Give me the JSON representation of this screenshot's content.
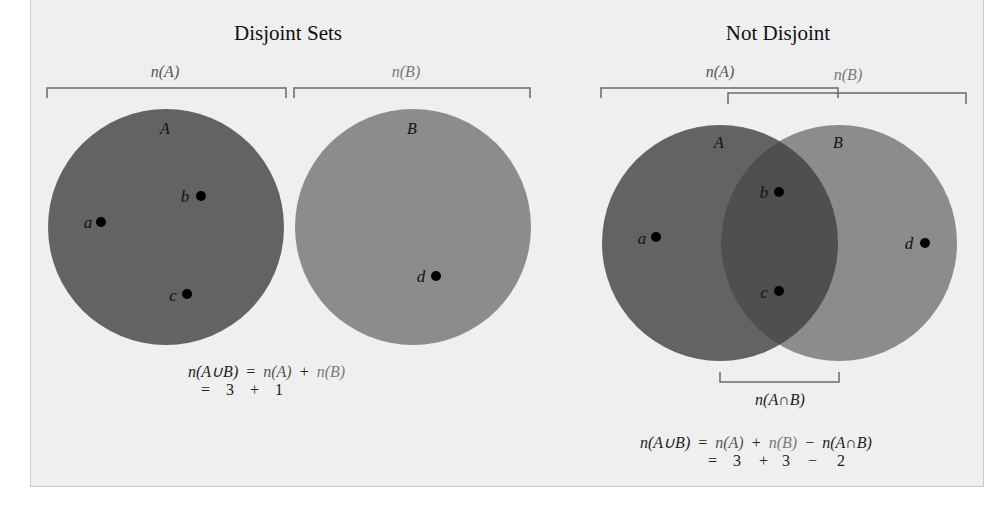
{
  "colors": {
    "background": "#efefef",
    "set_a_fill": "#636363",
    "set_b_fill": "#8c8c8c",
    "intersection_fill": "#4f4f4f",
    "bracket": "#6a6a6a"
  },
  "left": {
    "title": "Disjoint Sets",
    "bracket_a_label": "n(A)",
    "bracket_b_label": "n(B)",
    "set_a_name": "A",
    "set_b_name": "B",
    "points": {
      "a": "a",
      "b": "b",
      "c": "c",
      "d": "d"
    },
    "equation": {
      "lhs": "n(A∪B)",
      "eq": "=",
      "term1": "n(A)",
      "op1": "+",
      "term2": "n(B)",
      "line2_eq": "=",
      "v1": "3",
      "v_op1": "+",
      "v2": "1"
    }
  },
  "right": {
    "title": "Not Disjoint",
    "bracket_a_label": "n(A)",
    "bracket_b_label": "n(B)",
    "set_a_name": "A",
    "set_b_name": "B",
    "points": {
      "a": "a",
      "b": "b",
      "c": "c",
      "d": "d"
    },
    "intersection_label": "n(A∩B)",
    "equation": {
      "lhs": "n(A∪B)",
      "eq": "=",
      "term1": "n(A)",
      "op1": "+",
      "term2": "n(B)",
      "op2": "−",
      "term3": "n(A∩B)",
      "line2_eq": "=",
      "v1": "3",
      "v_op1": "+",
      "v2": "3",
      "v_op2": "−",
      "v3": "2"
    }
  }
}
